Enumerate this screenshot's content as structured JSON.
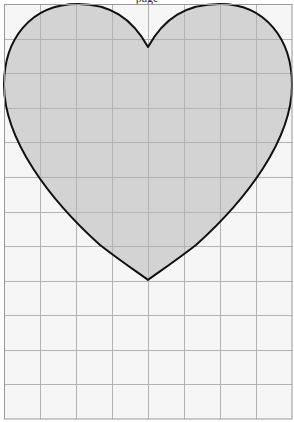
{
  "figure": {
    "title_fragment": "page",
    "colors": {
      "background": "#f6f6f6",
      "grid_line": "#b3b3b3",
      "heart_fill": "#d3d3d3",
      "heart_outline": "#111111",
      "border": "#999999"
    },
    "grid": {
      "left": 4,
      "top": 4,
      "right": 292,
      "bottom": 419,
      "columns": 8,
      "rows": 12
    },
    "shape": {
      "type": "heart",
      "notch": [
        148,
        47
      ],
      "bottom_point": [
        148,
        280
      ],
      "left_extreme_x": 4,
      "right_extreme_x": 292,
      "top_y": 4
    }
  }
}
